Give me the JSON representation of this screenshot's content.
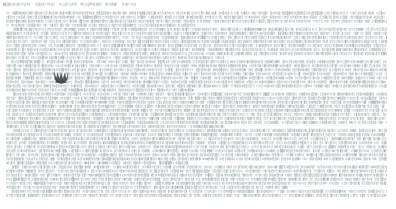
{
  "page": {
    "width": 396,
    "height": 209,
    "background_color": "#ffffff",
    "kind": "document-text-page",
    "zoom_state": "fit-width-minified",
    "legibility": "text-too-small-to-resolve"
  },
  "header": {
    "name": "header-title-line",
    "text": "",
    "legible": false,
    "ink_color": "#9aa0a6",
    "left": 2,
    "top": 1,
    "width": 134,
    "height": 7,
    "word_group_count": 6,
    "line_count": 1
  },
  "body": {
    "name": "document-body-text",
    "text": "",
    "legible": false,
    "ink_color": "#a8b0b2",
    "ink_color_dark": "#8d9699",
    "background_color": "#ffffff",
    "left": 6,
    "top": 10,
    "width": 381,
    "height": 188,
    "line_count": 46,
    "line_height": 4.05,
    "justified": true,
    "columns": 1,
    "paragraph_break_rows": [
      3,
      11,
      19,
      28,
      37,
      43
    ]
  },
  "cursor": {
    "name": "mouse-cursor",
    "shape": "crown-claw-mark",
    "color": "#3a3a3a",
    "left": 51,
    "top": 69,
    "width": 21,
    "height": 17
  },
  "margins": {
    "left": 6,
    "right": 9,
    "top": 10,
    "bottom": 11
  }
}
